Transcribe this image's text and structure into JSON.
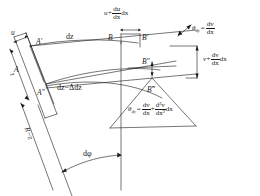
{
  "figure": {
    "type": "engineering-kinematics-diagram",
    "stroke_color": "#1a1a1a",
    "background_color": "#ffffff"
  },
  "points": {
    "a": "A",
    "a_prime": "A′",
    "a_double_prime": "A″",
    "b": "B",
    "b_prime": "B′",
    "b_double_prime": "B″",
    "b_triple_prime": "B‴"
  },
  "labels": {
    "u": "u",
    "z": "z",
    "dz": "dz",
    "dz_minus_delta": {
      "lead": "dz−",
      "delta": "Δ",
      "tail": "dz"
    },
    "r_minus_z": "R−z",
    "d_phi": "dφ"
  },
  "equations": {
    "u_plus_du": {
      "lead": "u+",
      "num": "du",
      "den": "dx",
      "tail": "dx"
    },
    "v_plus_dv": {
      "lead": "v+",
      "num": "dv",
      "den": "dx",
      "tail": "dx"
    },
    "theta_top": {
      "theta": "θ",
      "sub": "dy",
      "eq": "=",
      "num": "dv",
      "den": "dx"
    },
    "theta_bottom": {
      "theta": "θ",
      "sub": "dy",
      "eq": "=",
      "num1": "dv",
      "den1": "dx",
      "plus": "+",
      "num2": "d²v",
      "den2": "dx²",
      "tail": "dx"
    }
  }
}
